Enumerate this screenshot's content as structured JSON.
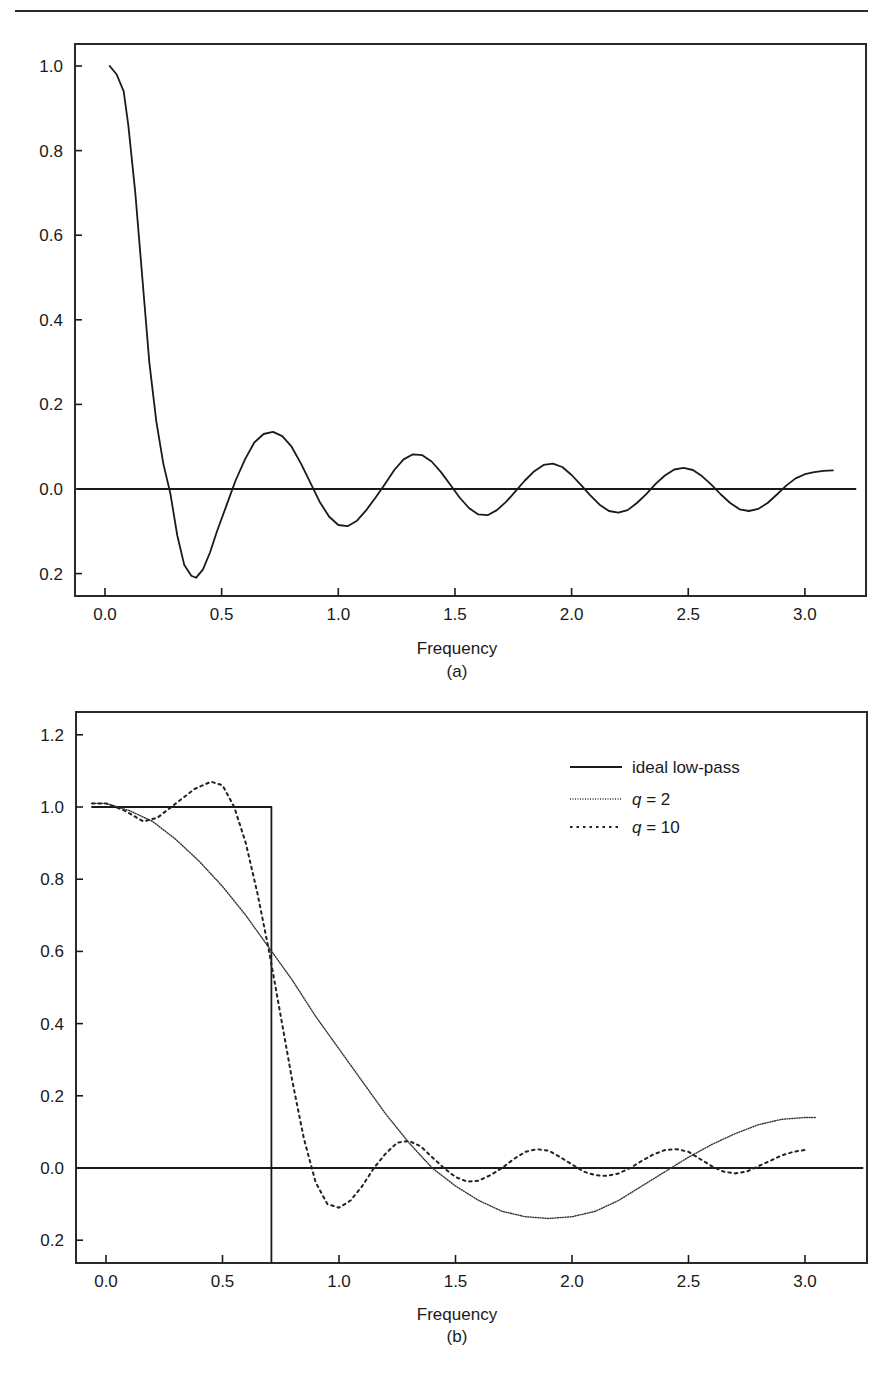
{
  "page": {
    "running_header": "",
    "figure_labels": [
      "(a)",
      "(b)"
    ]
  },
  "chart_data": [
    {
      "id": "a",
      "type": "line",
      "title": "",
      "subtitle": "(a)",
      "xlabel": "Frequency",
      "ylabel": "",
      "xlim": [
        -0.12,
        3.25
      ],
      "ylim": [
        -0.26,
        1.06
      ],
      "x_ticks": [
        0.0,
        0.5,
        1.0,
        1.5,
        2.0,
        2.5,
        3.0
      ],
      "x_tick_labels": [
        "0.0",
        "0.5",
        "1.0",
        "1.5",
        "2.0",
        "2.5",
        "3.0"
      ],
      "y_ticks": [
        1.0,
        0.8,
        0.6,
        0.4,
        0.2,
        0.0,
        -0.2
      ],
      "y_tick_labels": [
        "1.0",
        "0.8",
        "0.6",
        "0.4",
        "0.2",
        "0.0",
        "0.2"
      ],
      "grid": false,
      "reference_line": {
        "y": 0.0,
        "x_range": [
          -0.12,
          3.22
        ]
      },
      "legend": null,
      "series": [
        {
          "name": "frequency response",
          "style": "solid",
          "x": [
            0.02,
            0.05,
            0.08,
            0.1,
            0.13,
            0.16,
            0.19,
            0.22,
            0.25,
            0.28,
            0.31,
            0.34,
            0.37,
            0.39,
            0.42,
            0.45,
            0.48,
            0.52,
            0.56,
            0.6,
            0.64,
            0.68,
            0.72,
            0.76,
            0.8,
            0.84,
            0.88,
            0.92,
            0.96,
            1.0,
            1.04,
            1.08,
            1.12,
            1.16,
            1.2,
            1.24,
            1.28,
            1.32,
            1.36,
            1.4,
            1.44,
            1.48,
            1.52,
            1.56,
            1.6,
            1.64,
            1.68,
            1.72,
            1.76,
            1.8,
            1.84,
            1.88,
            1.92,
            1.96,
            2.0,
            2.04,
            2.08,
            2.12,
            2.16,
            2.2,
            2.24,
            2.28,
            2.32,
            2.36,
            2.4,
            2.44,
            2.48,
            2.52,
            2.56,
            2.6,
            2.64,
            2.68,
            2.72,
            2.76,
            2.8,
            2.84,
            2.88,
            2.92,
            2.96,
            3.0,
            3.04,
            3.08,
            3.12
          ],
          "values": [
            1.0,
            0.98,
            0.94,
            0.86,
            0.7,
            0.5,
            0.3,
            0.16,
            0.06,
            -0.01,
            -0.11,
            -0.18,
            -0.205,
            -0.21,
            -0.19,
            -0.15,
            -0.1,
            -0.04,
            0.02,
            0.07,
            0.11,
            0.13,
            0.135,
            0.125,
            0.1,
            0.06,
            0.015,
            -0.03,
            -0.065,
            -0.085,
            -0.088,
            -0.075,
            -0.05,
            -0.02,
            0.012,
            0.045,
            0.07,
            0.082,
            0.08,
            0.065,
            0.04,
            0.01,
            -0.02,
            -0.045,
            -0.06,
            -0.062,
            -0.05,
            -0.03,
            -0.005,
            0.02,
            0.042,
            0.057,
            0.06,
            0.052,
            0.033,
            0.01,
            -0.015,
            -0.037,
            -0.052,
            -0.056,
            -0.05,
            -0.033,
            -0.012,
            0.012,
            0.032,
            0.046,
            0.05,
            0.045,
            0.03,
            0.01,
            -0.013,
            -0.033,
            -0.048,
            -0.052,
            -0.047,
            -0.033,
            -0.013,
            0.008,
            0.025,
            0.035,
            0.04,
            0.043,
            0.044
          ]
        }
      ]
    },
    {
      "id": "b",
      "type": "line",
      "title": "",
      "subtitle": "(b)",
      "xlabel": "Frequency",
      "ylabel": "",
      "xlim": [
        -0.13,
        3.25
      ],
      "ylim": [
        -0.26,
        1.27
      ],
      "x_ticks": [
        0.0,
        0.5,
        1.0,
        1.5,
        2.0,
        2.5,
        3.0
      ],
      "x_tick_labels": [
        "0.0",
        "0.5",
        "1.0",
        "1.5",
        "2.0",
        "2.5",
        "3.0"
      ],
      "y_ticks": [
        1.2,
        1.0,
        0.8,
        0.6,
        0.4,
        0.2,
        0.0,
        -0.2
      ],
      "y_tick_labels": [
        "1.2",
        "1.0",
        "0.8",
        "0.6",
        "0.4",
        "0.2",
        "0.0",
        "0.2"
      ],
      "grid": false,
      "reference_line": {
        "y": 0.0,
        "x_range": [
          -0.13,
          3.25
        ]
      },
      "legend": {
        "position": "upper right",
        "entries": [
          {
            "label": "ideal low-pass",
            "prefix": "",
            "style": "solid"
          },
          {
            "label": " = 2",
            "prefix": "q",
            "style": "dotted"
          },
          {
            "label": " = 10",
            "prefix": "q",
            "style": "dashed"
          }
        ]
      },
      "series": [
        {
          "name": "ideal low-pass",
          "style": "solid",
          "x": [
            -0.06,
            0.71,
            0.71
          ],
          "values": [
            1.0,
            1.0,
            -0.26
          ]
        },
        {
          "name": "q = 2",
          "style": "dotted",
          "x": [
            -0.06,
            0.0,
            0.1,
            0.2,
            0.3,
            0.4,
            0.5,
            0.6,
            0.7,
            0.8,
            0.9,
            1.0,
            1.1,
            1.2,
            1.3,
            1.4,
            1.5,
            1.6,
            1.7,
            1.8,
            1.9,
            2.0,
            2.1,
            2.2,
            2.3,
            2.4,
            2.5,
            2.6,
            2.7,
            2.8,
            2.9,
            3.0,
            3.05
          ],
          "values": [
            1.01,
            1.01,
            0.99,
            0.96,
            0.91,
            0.85,
            0.78,
            0.7,
            0.61,
            0.52,
            0.42,
            0.33,
            0.24,
            0.15,
            0.07,
            0.0,
            -0.05,
            -0.09,
            -0.12,
            -0.135,
            -0.14,
            -0.135,
            -0.12,
            -0.09,
            -0.05,
            -0.01,
            0.03,
            0.065,
            0.095,
            0.12,
            0.135,
            0.14,
            0.14
          ]
        },
        {
          "name": "q = 10",
          "style": "dashed",
          "x": [
            -0.06,
            0.0,
            0.08,
            0.16,
            0.22,
            0.3,
            0.38,
            0.45,
            0.5,
            0.55,
            0.6,
            0.65,
            0.7,
            0.75,
            0.8,
            0.85,
            0.9,
            0.95,
            1.0,
            1.05,
            1.1,
            1.15,
            1.2,
            1.25,
            1.3,
            1.35,
            1.4,
            1.45,
            1.5,
            1.55,
            1.6,
            1.65,
            1.7,
            1.75,
            1.8,
            1.85,
            1.9,
            1.95,
            2.0,
            2.05,
            2.1,
            2.15,
            2.2,
            2.25,
            2.3,
            2.35,
            2.4,
            2.45,
            2.5,
            2.55,
            2.6,
            2.65,
            2.7,
            2.75,
            2.8,
            2.85,
            2.9,
            2.95,
            3.0
          ],
          "values": [
            1.01,
            1.01,
            0.99,
            0.96,
            0.97,
            1.01,
            1.05,
            1.07,
            1.06,
            1.0,
            0.9,
            0.76,
            0.6,
            0.42,
            0.24,
            0.08,
            -0.04,
            -0.1,
            -0.11,
            -0.09,
            -0.05,
            0.0,
            0.04,
            0.07,
            0.075,
            0.06,
            0.03,
            0.0,
            -0.025,
            -0.038,
            -0.035,
            -0.02,
            0.0,
            0.025,
            0.045,
            0.052,
            0.048,
            0.03,
            0.01,
            -0.01,
            -0.02,
            -0.022,
            -0.015,
            0.0,
            0.02,
            0.038,
            0.05,
            0.052,
            0.045,
            0.025,
            0.005,
            -0.01,
            -0.015,
            -0.01,
            0.005,
            0.02,
            0.035,
            0.045,
            0.05
          ]
        }
      ]
    }
  ]
}
